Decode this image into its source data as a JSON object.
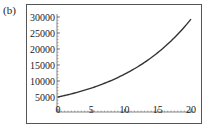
{
  "panel_label": "(b)",
  "colors": {
    "curve": "#333333",
    "axis": "#666666",
    "frame": "#555555",
    "text": "#222222"
  },
  "chart_data": {
    "type": "line",
    "title": "",
    "xlabel": "",
    "ylabel": "",
    "xlim": [
      0,
      20
    ],
    "ylim": [
      0,
      30000
    ],
    "grid": false,
    "legend": null,
    "x_ticks": [
      0,
      5,
      10,
      15,
      20
    ],
    "x_tick_labels": [
      "0",
      "5",
      "10",
      "15",
      "20"
    ],
    "y_ticks": [
      5000,
      10000,
      15000,
      20000,
      25000,
      30000
    ],
    "y_tick_labels": [
      "5000",
      "10000",
      "15000",
      "20000",
      "25000",
      "30000"
    ],
    "series": [
      {
        "name": "curve",
        "x": [
          0,
          2,
          4,
          6,
          8,
          10,
          12,
          14,
          16,
          18,
          20
        ],
        "y": [
          5000,
          5970,
          7120,
          8500,
          10150,
          12110,
          14460,
          17260,
          20600,
          24590,
          29350
        ]
      }
    ]
  }
}
